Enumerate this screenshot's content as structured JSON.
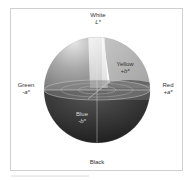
{
  "figure": {
    "type": "CIELAB color space sphere",
    "labels": {
      "white": {
        "name": "White",
        "axis": "L*"
      },
      "yellow": {
        "name": "Yellow",
        "axis": "+b*"
      },
      "green": {
        "name": "Green",
        "axis": "-a*"
      },
      "red": {
        "name": "Red",
        "axis": "+a*"
      },
      "blue": {
        "name": "Blue",
        "axis": "-b*"
      },
      "black": {
        "name": "Black"
      }
    },
    "colors": {
      "frame_border": "#cfcfcf",
      "sphere_top_left": "#9a9a9a",
      "sphere_top_right": "#b4b4b4",
      "sphere_bottom": "#2a2a2a",
      "highlight": "#f2f2f2"
    }
  }
}
